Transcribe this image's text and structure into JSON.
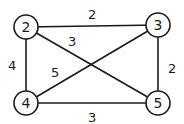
{
  "graph": {
    "type": "weighted-undirected",
    "nodes": [
      {
        "id": "2",
        "label": "2",
        "x": 26,
        "y": 27
      },
      {
        "id": "3",
        "label": "3",
        "x": 158,
        "y": 25
      },
      {
        "id": "4",
        "label": "4",
        "x": 26,
        "y": 103
      },
      {
        "id": "5",
        "label": "5",
        "x": 158,
        "y": 103
      }
    ],
    "edges": [
      {
        "from": "2",
        "to": "3",
        "weight": "2"
      },
      {
        "from": "2",
        "to": "5",
        "weight": "3"
      },
      {
        "from": "2",
        "to": "4",
        "weight": "4"
      },
      {
        "from": "4",
        "to": "3",
        "weight": "5"
      },
      {
        "from": "3",
        "to": "5",
        "weight": "2"
      },
      {
        "from": "4",
        "to": "5",
        "weight": "3"
      }
    ]
  }
}
